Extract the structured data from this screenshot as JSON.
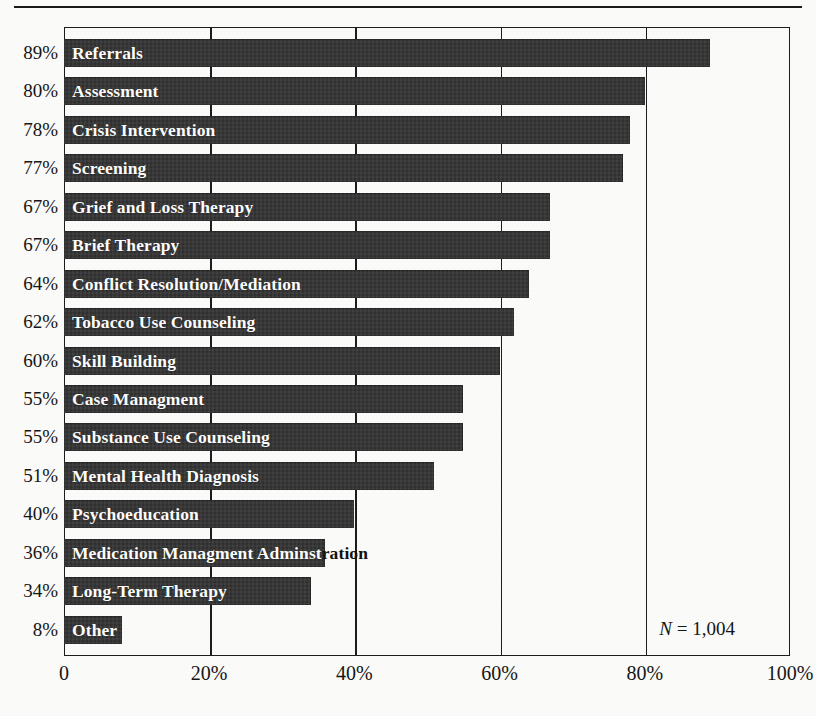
{
  "page": {
    "background_color": "#fbfbf9",
    "rule_color": "#1a1a1a"
  },
  "chart_data": {
    "type": "bar",
    "orientation": "horizontal",
    "title": "",
    "subtitle": "",
    "xlabel": "",
    "ylabel": "",
    "xlim": [
      0,
      100
    ],
    "grid": true,
    "legend": null,
    "bar_color": "#333333",
    "annotation": "N = 1,004",
    "annotation_n_label": "N",
    "annotation_n_value": "= 1,004",
    "xticks": [
      "0",
      "20%",
      "40%",
      "60%",
      "80%",
      "100%"
    ],
    "xtick_values": [
      0,
      20,
      40,
      60,
      80,
      100
    ],
    "categories": [
      "Referrals",
      "Assessment",
      "Crisis Intervention",
      "Screening",
      "Grief and Loss Therapy",
      "Brief Therapy",
      "Conflict Resolution/Mediation",
      "Tobacco Use Counseling",
      "Skill Building",
      "Case Managment",
      "Substance Use Counseling",
      "Mental Health Diagnosis",
      "Psychoeducation",
      "Medication Managment Adminstration",
      "Long-Term Therapy",
      "Other"
    ],
    "values": [
      89,
      80,
      78,
      77,
      67,
      67,
      64,
      62,
      60,
      55,
      55,
      51,
      40,
      36,
      34,
      8
    ],
    "value_labels": [
      "89%",
      "80%",
      "78%",
      "77%",
      "67%",
      "67%",
      "64%",
      "62%",
      "60%",
      "55%",
      "55%",
      "51%",
      "40%",
      "36%",
      "34%",
      "8%"
    ]
  }
}
